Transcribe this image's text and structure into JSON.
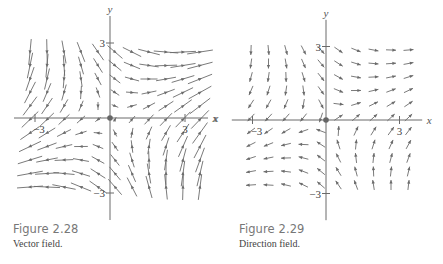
{
  "figures": [
    {
      "id": "fig1",
      "caption_title": "Figure 2.28",
      "caption_text": "Vector field.",
      "axes": {
        "origin_px": [
          110,
          118
        ],
        "unit_px": 25,
        "x_label": "x",
        "y_label": "y",
        "x_ticks": [
          "−3",
          "3"
        ],
        "y_ticks": [
          "3",
          "−3"
        ],
        "extra_x_label": false
      },
      "field": {
        "type": "vector",
        "scale": "magnitude",
        "fx": "x + y",
        "fy": "x - y"
      },
      "grid": {
        "cols": 11,
        "rows": 11,
        "x0_px": 30,
        "y0_px": 52,
        "dx_px": 17,
        "dy_px": 13.5
      }
    },
    {
      "id": "fig2",
      "caption_title": "Figure 2.29",
      "caption_text": "Direction field.",
      "axes": {
        "origin_px": [
          111,
          120
        ],
        "unit_px": 24.5,
        "x_label": "x",
        "y_label": "y",
        "x_ticks": [
          "−3",
          "3"
        ],
        "y_ticks": [
          "3",
          "−3"
        ],
        "extra_x_label": true
      },
      "field": {
        "type": "direction",
        "scale": "unit",
        "fx": "x + y",
        "fy": "x - y"
      },
      "grid": {
        "cols": 10,
        "rows": 11,
        "x0_px": 36,
        "y0_px": 50,
        "dx_px": 17.5,
        "dy_px": 13.5
      }
    }
  ],
  "chart_data": [
    {
      "type": "vector_field",
      "title": "Figure 2.28",
      "subtitle": "Vector field.",
      "xlabel": "x",
      "ylabel": "y",
      "xlim": [
        -3.5,
        3.5
      ],
      "ylim": [
        -3.5,
        3.5
      ],
      "x_tick_labels": [
        "−3",
        "3"
      ],
      "y_tick_labels": [
        "−3",
        "3"
      ],
      "grid": false,
      "arrow_length": "proportional to magnitude",
      "quadrant_directions": {
        "I": "right",
        "II": "down-left",
        "III": "left",
        "IV": "up-right"
      },
      "approx_field": "F(x,y) = (x + y, x − y)"
    },
    {
      "type": "direction_field",
      "title": "Figure 2.29",
      "subtitle": "Direction field.",
      "xlabel": "x",
      "ylabel": "y",
      "xlim": [
        -3.5,
        3.5
      ],
      "ylim": [
        -3.5,
        3.5
      ],
      "x_tick_labels": [
        "−3",
        "3"
      ],
      "y_tick_labels": [
        "−3",
        "3"
      ],
      "grid": false,
      "arrow_length": "uniform (unit vectors)",
      "quadrant_directions": {
        "I": "right",
        "II": "down-left",
        "III": "left",
        "IV": "up-right"
      },
      "approx_field": "F(x,y)/|F(x,y)|, F = (x + y, x − y)"
    }
  ],
  "colors": {
    "ink": "#6b6b6b",
    "caption_title": "#777777",
    "caption_text": "#444444",
    "background": "#ffffff"
  }
}
